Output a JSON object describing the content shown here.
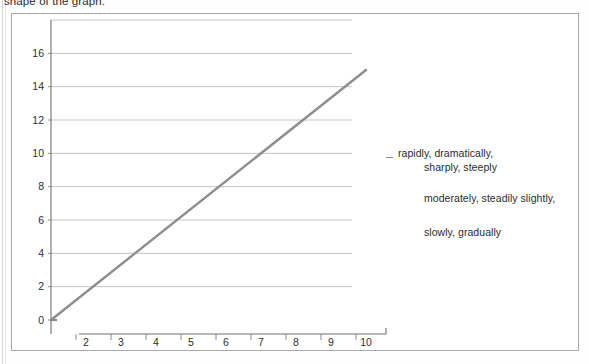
{
  "document": {
    "top_text": "shape of the graph."
  },
  "vocabulary": {
    "groups": [
      {
        "id": "rapid",
        "line1": "rapidly, dramatically,",
        "line2": "sharply, steeply"
      },
      {
        "id": "moderate",
        "line1": "moderately, steadily slightly,",
        "line2": ""
      },
      {
        "id": "slow",
        "line1": "slowly, gradually",
        "line2": ""
      }
    ]
  },
  "chart_data": {
    "type": "line",
    "title": "",
    "xlabel": "",
    "ylabel": "",
    "x": [
      1,
      10
    ],
    "values": [
      0,
      15
    ],
    "series": [
      {
        "name": "trend",
        "points": [
          [
            1,
            0
          ],
          [
            10,
            15
          ]
        ],
        "color": "#8d8d8d"
      }
    ],
    "xlim": [
      1,
      10
    ],
    "ylim": [
      0,
      18
    ],
    "x_ticks": [
      "1",
      "2",
      "3",
      "4",
      "5",
      "6",
      "7",
      "8",
      "9",
      "10"
    ],
    "y_ticks": [
      "0",
      "2",
      "4",
      "6",
      "8",
      "10",
      "12",
      "14",
      "16"
    ],
    "grid": true,
    "grid_color": "#b6b6b6",
    "axis_color": "#707070",
    "legend": "none"
  }
}
